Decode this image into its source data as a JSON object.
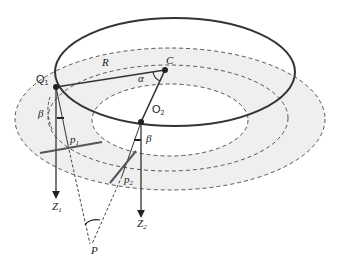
{
  "labels": {
    "Q1": "Q",
    "Q1_sub": "1",
    "R": "R",
    "C": "C",
    "alpha": "α",
    "O2": "O",
    "O2_sub": "2",
    "beta_left": "β",
    "beta_right": "β",
    "p1": "p",
    "p1_sub": "1",
    "p2": "p",
    "p2_sub": "2",
    "Z1": "Z",
    "Z1_sub": "1",
    "Z2": "Z",
    "Z2_sub": "2",
    "P": "P"
  },
  "colors": {
    "stroke": "#333333",
    "shade": "#efefef",
    "dash": "#555555"
  }
}
